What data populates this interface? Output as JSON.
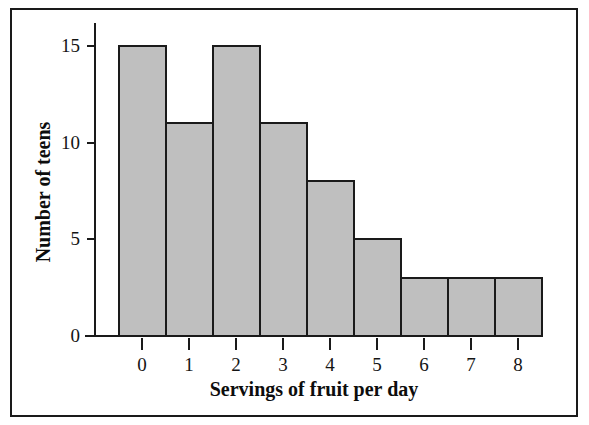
{
  "figure": {
    "border_color": "#1a1a1a",
    "background": "#ffffff"
  },
  "chart_data": {
    "type": "bar",
    "title": "",
    "subtitle": "",
    "xlabel": "Servings of fruit per day",
    "ylabel": "Number of teens",
    "categories": [
      "0",
      "1",
      "2",
      "3",
      "4",
      "5",
      "6",
      "7",
      "8"
    ],
    "values": [
      15,
      11,
      15,
      11,
      8,
      5,
      3,
      3,
      3
    ],
    "xtick_labels": [
      "0",
      "1",
      "2",
      "3",
      "4",
      "5",
      "6",
      "7",
      "8"
    ],
    "ytick_labels": [
      "0",
      "5",
      "10",
      "15"
    ],
    "ytick_values": [
      0,
      5,
      10,
      15
    ],
    "ylim": [
      0,
      15.6
    ],
    "grid": false,
    "legend": false,
    "legend_position": "none",
    "bar_fill": "#bfbfbf",
    "bar_edge": "#1a1a1a",
    "annotations": []
  }
}
